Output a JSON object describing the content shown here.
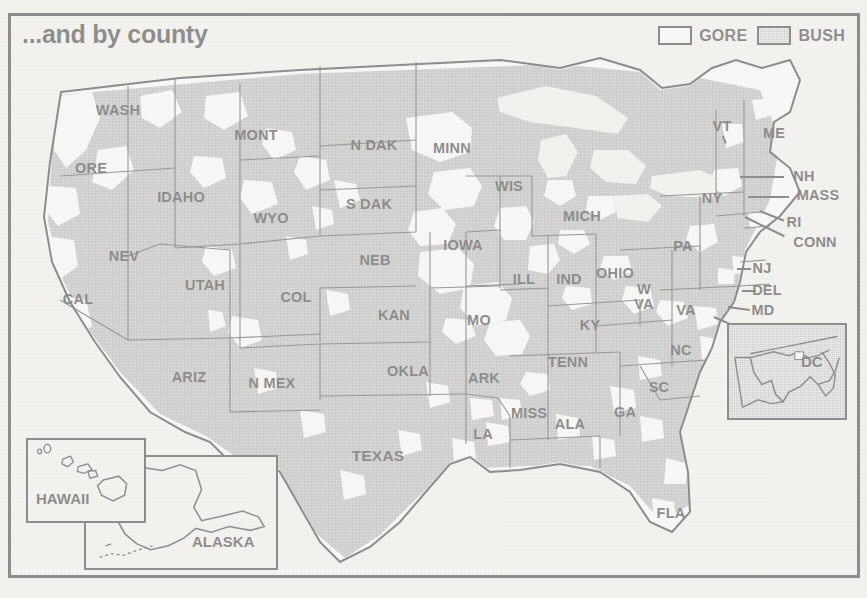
{
  "title": "...and by county",
  "legend": {
    "entries": [
      {
        "label": "GORE",
        "swatch": "white-swatch",
        "color": "#ffffff"
      },
      {
        "label": "BUSH",
        "swatch": "gray-swatch",
        "color": "#a9a9a9"
      }
    ]
  },
  "colors": {
    "bush_fill": "#a9a9a9",
    "gore_fill": "#ffffff",
    "outline": "#141414",
    "paper": "#f3f2ef"
  },
  "map": {
    "type": "choropleth-county-map",
    "region": "United States",
    "state_labels": [
      {
        "id": "wash",
        "text": "WASH",
        "x": 118,
        "y": 110
      },
      {
        "id": "ore",
        "text": "ORE",
        "x": 91,
        "y": 168
      },
      {
        "id": "cal",
        "text": "CAL",
        "x": 78,
        "y": 299
      },
      {
        "id": "nev",
        "text": "NEV",
        "x": 124,
        "y": 256
      },
      {
        "id": "idaho",
        "text": "IDAHO",
        "x": 181,
        "y": 197
      },
      {
        "id": "utah",
        "text": "UTAH",
        "x": 205,
        "y": 285
      },
      {
        "id": "ariz",
        "text": "ARIZ",
        "x": 189,
        "y": 377
      },
      {
        "id": "mont",
        "text": "MONT",
        "x": 256,
        "y": 135
      },
      {
        "id": "wyo",
        "text": "WYO",
        "x": 271,
        "y": 218
      },
      {
        "id": "col",
        "text": "COL",
        "x": 296,
        "y": 297
      },
      {
        "id": "nmex",
        "text": "N MEX",
        "x": 272,
        "y": 383
      },
      {
        "id": "ndak",
        "text": "N DAK",
        "x": 374,
        "y": 145
      },
      {
        "id": "sdak",
        "text": "S DAK",
        "x": 369,
        "y": 204
      },
      {
        "id": "neb",
        "text": "NEB",
        "x": 375,
        "y": 260
      },
      {
        "id": "kan",
        "text": "KAN",
        "x": 394,
        "y": 315
      },
      {
        "id": "okla",
        "text": "OKLA",
        "x": 408,
        "y": 371
      },
      {
        "id": "texas",
        "text": "TEXAS",
        "x": 378,
        "y": 456
      },
      {
        "id": "minn",
        "text": "MINN",
        "x": 452,
        "y": 148
      },
      {
        "id": "iowa",
        "text": "IOWA",
        "x": 463,
        "y": 245
      },
      {
        "id": "mo",
        "text": "MO",
        "x": 479,
        "y": 320
      },
      {
        "id": "ark",
        "text": "ARK",
        "x": 484,
        "y": 378
      },
      {
        "id": "la",
        "text": "LA",
        "x": 483,
        "y": 434
      },
      {
        "id": "wis",
        "text": "WIS",
        "x": 509,
        "y": 186
      },
      {
        "id": "ill",
        "text": "ILL",
        "x": 524,
        "y": 279
      },
      {
        "id": "miss",
        "text": "MISS",
        "x": 529,
        "y": 413
      },
      {
        "id": "ind",
        "text": "IND",
        "x": 569,
        "y": 279
      },
      {
        "id": "mich",
        "text": "MICH",
        "x": 582,
        "y": 216
      },
      {
        "id": "tenn",
        "text": "TENN",
        "x": 568,
        "y": 362
      },
      {
        "id": "ala",
        "text": "ALA",
        "x": 570,
        "y": 424
      },
      {
        "id": "ky",
        "text": "KY",
        "x": 590,
        "y": 325
      },
      {
        "id": "ohio",
        "text": "OHIO",
        "x": 615,
        "y": 273
      },
      {
        "id": "wva",
        "text": "W\nVA",
        "x": 644,
        "y": 297
      },
      {
        "id": "va",
        "text": "VA",
        "x": 686,
        "y": 310
      },
      {
        "id": "ga",
        "text": "GA",
        "x": 625,
        "y": 412
      },
      {
        "id": "sc",
        "text": "SC",
        "x": 659,
        "y": 387
      },
      {
        "id": "nc",
        "text": "NC",
        "x": 681,
        "y": 350
      },
      {
        "id": "fla",
        "text": "FLA",
        "x": 671,
        "y": 513
      },
      {
        "id": "pa",
        "text": "PA",
        "x": 683,
        "y": 246
      },
      {
        "id": "ny",
        "text": "NY",
        "x": 712,
        "y": 198
      },
      {
        "id": "vt",
        "text": "VT",
        "x": 722,
        "y": 126
      },
      {
        "id": "me",
        "text": "ME",
        "x": 774,
        "y": 133
      },
      {
        "id": "nh",
        "text": "NH",
        "x": 804,
        "y": 176
      },
      {
        "id": "mass",
        "text": "MASS",
        "x": 818,
        "y": 195
      },
      {
        "id": "ri",
        "text": "RI",
        "x": 794,
        "y": 222
      },
      {
        "id": "conn",
        "text": "CONN",
        "x": 815,
        "y": 242
      },
      {
        "id": "nj",
        "text": "NJ",
        "x": 762,
        "y": 268
      },
      {
        "id": "del",
        "text": "DEL",
        "x": 767,
        "y": 290
      },
      {
        "id": "md",
        "text": "MD",
        "x": 763,
        "y": 310
      }
    ]
  },
  "insets": [
    {
      "id": "hawaii",
      "label": "HAWAII"
    },
    {
      "id": "alaska",
      "label": "ALASKA"
    },
    {
      "id": "dc",
      "label": "DC"
    }
  ]
}
